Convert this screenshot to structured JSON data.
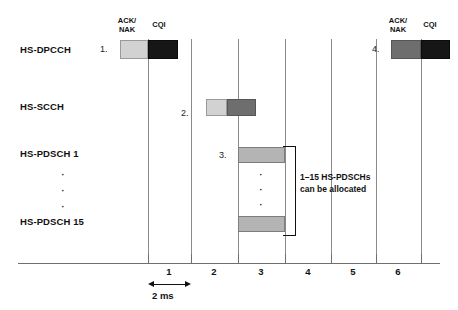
{
  "diagram": {
    "rows": [
      {
        "id": "hs-dpcch",
        "label": "HS-DPCCH"
      },
      {
        "id": "hs-scch",
        "label": "HS-SCCH"
      },
      {
        "id": "hs-pdsch-1",
        "label": "HS-PDSCH 1"
      },
      {
        "id": "hs-pdsch-15",
        "label": "HS-PDSCH 15"
      }
    ],
    "row_gap_dots": "·",
    "markers": [
      {
        "id": "marker-1",
        "label": "1."
      },
      {
        "id": "marker-2",
        "label": "2."
      },
      {
        "id": "marker-3",
        "label": "3."
      },
      {
        "id": "marker-4",
        "label": "4."
      }
    ],
    "captions": {
      "ack_nak_line1": "ACK/",
      "ack_nak_line2": "NAK",
      "cqi": "CQI"
    },
    "annotation": {
      "line1": "1–15 HS-PDSCHs",
      "line2": "can be allocated"
    },
    "timeline": {
      "numbers": [
        "1",
        "2",
        "3",
        "4",
        "5",
        "6"
      ],
      "interval_label": "2 ms"
    },
    "colors": {
      "ack_nak_light": "#d2d2d2",
      "ack_nak_mid": "#6e6e6e",
      "cqi_dark": "#161616",
      "scch_left": "#d2d2d2",
      "scch_right": "#6e6e6e",
      "pdsch_bar": "#b4b4b4",
      "gridline": "#8a8a8a",
      "axis": "#6f6f6f",
      "text": "#111111"
    }
  }
}
